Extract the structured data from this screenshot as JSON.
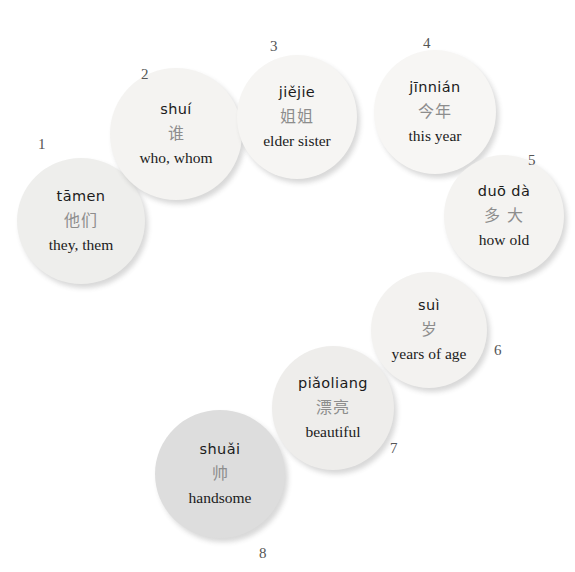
{
  "page": {
    "background_color": "#ffffff",
    "layout": "arc of eight circular vocabulary flashcards, numbered 1-8"
  },
  "cards": [
    {
      "number": "1",
      "pinyin": "tāmen",
      "hanzi": "他们",
      "english": "they, them",
      "fill": "#eeeeec"
    },
    {
      "number": "2",
      "pinyin": "shuí",
      "hanzi": "谁",
      "english": "who, whom",
      "fill": "#f4f3f1"
    },
    {
      "number": "3",
      "pinyin": "jiějie",
      "hanzi": "姐姐",
      "english": "elder sister",
      "fill": "#f6f5f3"
    },
    {
      "number": "4",
      "pinyin": "jīnnián",
      "hanzi": "今年",
      "english": "this year",
      "fill": "#f7f6f4"
    },
    {
      "number": "5",
      "pinyin": "duō dà",
      "hanzi": "多 大",
      "english": "how old",
      "fill": "#f4f3f1"
    },
    {
      "number": "6",
      "pinyin": "suì",
      "hanzi": "岁",
      "english": "years of age",
      "fill": "#f3f2f0"
    },
    {
      "number": "7",
      "pinyin": "piǎoliang",
      "hanzi": "漂亮",
      "english": "beautiful",
      "fill": "#eeedeb"
    },
    {
      "number": "8",
      "pinyin": "shuǎi",
      "hanzi": "帅",
      "english": "handsome",
      "fill": "#dddddd"
    }
  ]
}
